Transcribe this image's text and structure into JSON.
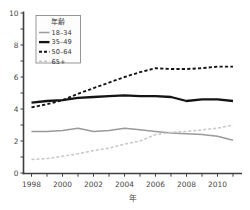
{
  "chart_data": {
    "type": "line",
    "title": "",
    "xlabel": "年",
    "ylabel": "",
    "legend_title": "年齢",
    "legend_position": "top-left",
    "grid": false,
    "x": [
      1998,
      1999,
      2000,
      2001,
      2002,
      2003,
      2004,
      2005,
      2006,
      2007,
      2008,
      2009,
      2010,
      2011
    ],
    "series": [
      {
        "name": "18–34",
        "color": "#9a9a9a",
        "width": 1.5,
        "dash": "",
        "values": [
          2.6,
          2.6,
          2.65,
          2.8,
          2.6,
          2.65,
          2.8,
          2.7,
          2.6,
          2.5,
          2.45,
          2.4,
          2.3,
          2.05
        ]
      },
      {
        "name": "35–49",
        "color": "#141414",
        "width": 2.3,
        "dash": "",
        "values": [
          4.4,
          4.5,
          4.55,
          4.7,
          4.75,
          4.8,
          4.85,
          4.8,
          4.8,
          4.75,
          4.5,
          4.6,
          4.6,
          4.5
        ]
      },
      {
        "name": "50–64",
        "color": "#141414",
        "width": 1.9,
        "dash": "3.2 2.2",
        "values": [
          4.1,
          4.3,
          4.55,
          4.95,
          5.3,
          5.65,
          6.0,
          6.3,
          6.55,
          6.5,
          6.5,
          6.55,
          6.65,
          6.65
        ]
      },
      {
        "name": "65+",
        "color": "#c7c7c7",
        "width": 1.5,
        "dash": "3 2",
        "values": [
          0.85,
          0.9,
          1.05,
          1.2,
          1.4,
          1.55,
          1.8,
          2.0,
          2.4,
          2.55,
          2.6,
          2.7,
          2.8,
          3.0
        ]
      }
    ],
    "xlim": [
      1998,
      2011
    ],
    "ylim": [
      0,
      10
    ],
    "yticks": [
      0,
      2,
      4,
      6,
      8,
      10
    ],
    "ytick_minor_step": 1,
    "xtick_minor_step": 1,
    "xtick_label_years": [
      1998,
      2000,
      2002,
      2004,
      2006,
      2008,
      2010
    ],
    "axis_color": "#3f3f3f",
    "text_color": "#474747"
  }
}
